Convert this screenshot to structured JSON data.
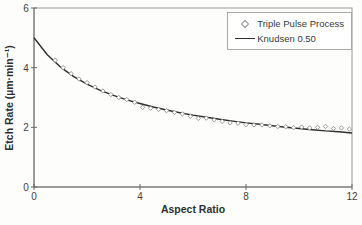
{
  "chart_data": {
    "type": "scatter",
    "title": "",
    "xlabel": "Aspect Ratio",
    "ylabel": "Etch Rate (µm·min⁻¹)",
    "xlim": [
      0,
      12
    ],
    "ylim": [
      0,
      6
    ],
    "xticks": [
      "0",
      "4",
      "8",
      "12"
    ],
    "xtick_values": [
      0,
      4,
      8,
      12
    ],
    "yticks": [
      "0",
      "2",
      "4",
      "6"
    ],
    "ytick_values": [
      0,
      2,
      4,
      6
    ],
    "grid": false,
    "legend_position": "top-right",
    "colors": {
      "scatter_marker": "#8f8f8f",
      "fit_line": "#2e2e2e",
      "plot_border": "#9b9b9b",
      "axis_line": "#6a6a6a",
      "text": "#3f3f3f"
    },
    "series": [
      {
        "name": "Triple Pulse Process",
        "type": "scatter",
        "marker": "open-diamond",
        "points": [
          [
            0.8,
            4.25
          ],
          [
            1.1,
            4.0
          ],
          [
            1.4,
            3.8
          ],
          [
            1.7,
            3.62
          ],
          [
            2.0,
            3.5
          ],
          [
            2.3,
            3.35
          ],
          [
            2.6,
            3.22
          ],
          [
            2.9,
            3.1
          ],
          [
            3.2,
            3.0
          ],
          [
            3.5,
            2.93
          ],
          [
            3.8,
            2.84
          ],
          [
            4.1,
            2.67
          ],
          [
            4.4,
            2.64
          ],
          [
            4.7,
            2.6
          ],
          [
            5.0,
            2.56
          ],
          [
            5.3,
            2.5
          ],
          [
            5.6,
            2.45
          ],
          [
            5.9,
            2.37
          ],
          [
            6.2,
            2.3
          ],
          [
            6.5,
            2.31
          ],
          [
            6.8,
            2.25
          ],
          [
            7.1,
            2.2
          ],
          [
            7.4,
            2.15
          ],
          [
            7.7,
            2.14
          ],
          [
            8.0,
            2.09
          ],
          [
            8.3,
            2.08
          ],
          [
            8.6,
            2.08
          ],
          [
            8.9,
            2.05
          ],
          [
            9.2,
            2.03
          ],
          [
            9.5,
            2.02
          ],
          [
            9.8,
            1.99
          ],
          [
            10.1,
            2.01
          ],
          [
            10.4,
            1.98
          ],
          [
            10.7,
            2.0
          ],
          [
            11.0,
            2.03
          ],
          [
            11.3,
            1.96
          ],
          [
            11.6,
            1.98
          ],
          [
            11.9,
            1.94
          ]
        ]
      },
      {
        "name": "Knudsen 0.50",
        "type": "line",
        "points": [
          [
            0,
            5.0
          ],
          [
            0.5,
            4.43
          ],
          [
            1.0,
            4.02
          ],
          [
            1.5,
            3.7
          ],
          [
            2.0,
            3.45
          ],
          [
            2.5,
            3.24
          ],
          [
            3.0,
            3.07
          ],
          [
            3.5,
            2.92
          ],
          [
            4.0,
            2.8
          ],
          [
            4.5,
            2.68
          ],
          [
            5.0,
            2.58
          ],
          [
            5.5,
            2.49
          ],
          [
            6.0,
            2.41
          ],
          [
            6.5,
            2.34
          ],
          [
            7.0,
            2.27
          ],
          [
            7.5,
            2.21
          ],
          [
            8.0,
            2.15
          ],
          [
            8.5,
            2.1
          ],
          [
            9.0,
            2.05
          ],
          [
            9.5,
            2.0
          ],
          [
            10.0,
            1.96
          ],
          [
            10.5,
            1.92
          ],
          [
            11.0,
            1.88
          ],
          [
            11.5,
            1.85
          ],
          [
            12.0,
            1.81
          ]
        ]
      }
    ]
  }
}
